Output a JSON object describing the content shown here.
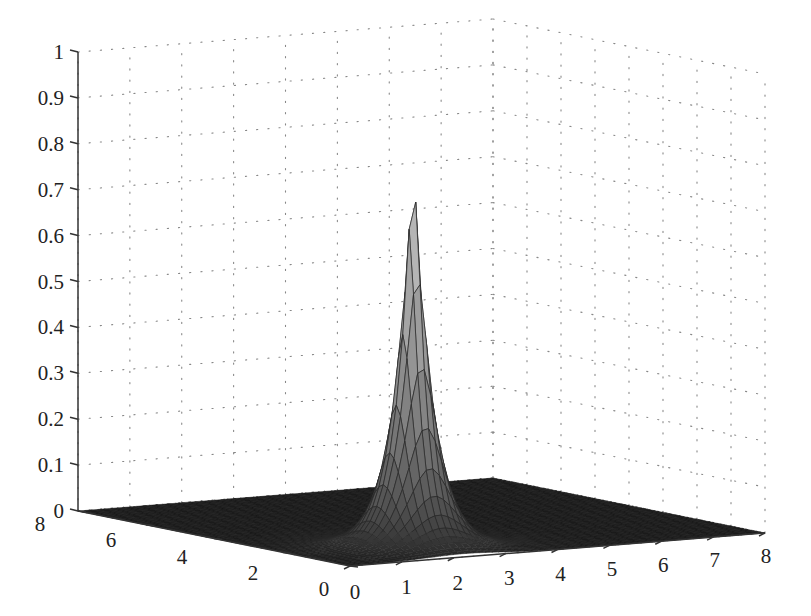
{
  "chart_data": {
    "type": "surface3d",
    "title": "",
    "xlabel": "",
    "ylabel": "",
    "zlabel": "",
    "function_description": "Sharp peak (exponential decay) centered near x=2.2, y=1.5 with max ~0.88, flat zero elsewhere",
    "x_ticks": [
      "0",
      "1",
      "2",
      "3",
      "4",
      "5",
      "6",
      "7",
      "8"
    ],
    "y_ticks": [
      "0",
      "2",
      "4",
      "6",
      "8"
    ],
    "z_ticks": [
      "0",
      "0.1",
      "0.2",
      "0.3",
      "0.4",
      "0.5",
      "0.6",
      "0.7",
      "0.8",
      "0.9",
      "1"
    ],
    "xlim": [
      0,
      8
    ],
    "ylim": [
      0,
      8
    ],
    "zlim": [
      0,
      1
    ],
    "peak": {
      "x": 2.2,
      "y": 1.5,
      "z": 0.88
    },
    "grid": true,
    "grid_style": "dotted",
    "colormap": "gray",
    "mesh_lines": true
  },
  "colors": {
    "background": "#ffffff",
    "axis": "#333333",
    "grid": "#888888",
    "surface_low": "#1a1a1a",
    "surface_high": "#d8d8d8"
  }
}
